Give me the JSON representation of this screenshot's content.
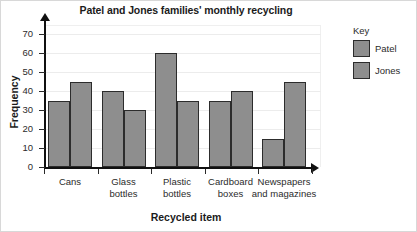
{
  "chart_data": {
    "type": "bar",
    "title": "Patel and Jones families' monthly recycling",
    "xlabel": "Recycled item",
    "ylabel": "Frequency",
    "categories": [
      "Cans",
      "Glass bottles",
      "Plastic bottles",
      "Cardboard boxes",
      "Newspapers and magazines"
    ],
    "category_lines": [
      [
        "Cans"
      ],
      [
        "Glass",
        "bottles"
      ],
      [
        "Plastic",
        "bottles"
      ],
      [
        "Cardboard",
        "boxes"
      ],
      [
        "Newspapers",
        "and magazines"
      ]
    ],
    "series": [
      {
        "name": "Patel",
        "values": [
          35,
          40,
          60,
          35,
          15
        ],
        "color": "#8e8e8e"
      },
      {
        "name": "Jones",
        "values": [
          45,
          30,
          35,
          40,
          45
        ],
        "color": "#8e8e8e"
      }
    ],
    "ylim": [
      0,
      75
    ],
    "yticks": [
      0,
      10,
      20,
      30,
      40,
      50,
      60,
      70
    ],
    "ytick_labels": [
      "0",
      "10",
      "20",
      "30",
      "40",
      "50",
      "60",
      "70"
    ],
    "grid": true,
    "legend_position": "right",
    "legend_title": "Key",
    "bar_edge_color": "#2c2c2c",
    "axis_color": "#101010"
  }
}
